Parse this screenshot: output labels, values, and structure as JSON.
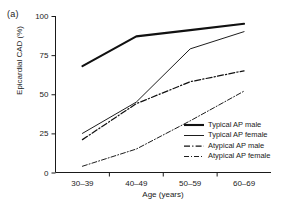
{
  "figure": {
    "panel_label": "(a)",
    "accent_color": "#111111",
    "background_color": "#ffffff"
  },
  "chart_data": {
    "type": "line",
    "title": "",
    "xlabel": "Age (years)",
    "ylabel": "Epicardial CAD (%)",
    "categories": [
      "30–39",
      "40–49",
      "50–59",
      "60–69"
    ],
    "ylim": [
      0,
      100
    ],
    "yticks": [
      0,
      25,
      50,
      75,
      100
    ],
    "ytick_labels": [
      "0",
      "25",
      "50",
      "75",
      "100"
    ],
    "grid": false,
    "legend_position": "lower right (inside axes)",
    "series": [
      {
        "name": "Typical AP male",
        "style": "solid",
        "linewidth": "thick",
        "values": [
          68,
          87,
          91,
          95
        ]
      },
      {
        "name": "Typical AP female",
        "style": "solid",
        "linewidth": "thin",
        "values": [
          25,
          45,
          79,
          90
        ]
      },
      {
        "name": "Atypical AP male",
        "style": "dash-dot",
        "linewidth": "medium",
        "values": [
          21,
          44,
          58,
          65
        ]
      },
      {
        "name": "Atypical AP female",
        "style": "dash-dot",
        "linewidth": "thin",
        "values": [
          4,
          15,
          33,
          52
        ]
      }
    ]
  }
}
